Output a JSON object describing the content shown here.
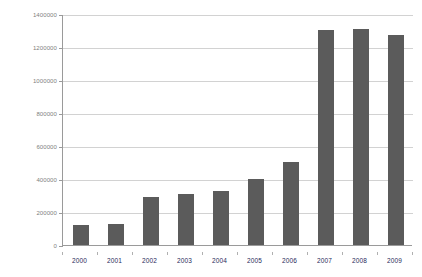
{
  "chart_data": {
    "type": "bar",
    "title": "",
    "xlabel": "",
    "ylabel": "",
    "categories": [
      "2000",
      "2001",
      "2002",
      "2003",
      "2004",
      "2005",
      "2006",
      "2007",
      "2008",
      "2009"
    ],
    "values": [
      120000,
      130000,
      290000,
      310000,
      330000,
      400000,
      505000,
      1305000,
      1310000,
      1270000
    ],
    "ylim": [
      0,
      1400000
    ],
    "ytick_labels": [
      "1400000",
      "1200000",
      "1000000",
      "800000",
      "600000",
      "400000",
      "200000",
      "0"
    ],
    "ytick_values": [
      1400000,
      1200000,
      1000000,
      800000,
      600000,
      400000,
      200000,
      0
    ],
    "grid": true,
    "legend": "none",
    "bar_color": "#5b5b5b",
    "gridline_color": "#d2d2d2",
    "axis_color": "#9a9a9a",
    "ytick_label_color": "#808080",
    "xtick_label_color": "#1f2b5b",
    "background_color": "#ffffff"
  }
}
